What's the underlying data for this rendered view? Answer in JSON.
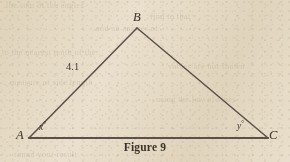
{
  "figure": {
    "caption": "Figure 9",
    "background_color": "#ece3d2",
    "ink_color": "#5a5148",
    "shape": "triangle",
    "vertices": [
      {
        "name": "B",
        "label": "B",
        "x": 137,
        "y": 28
      },
      {
        "name": "A",
        "label": "A",
        "x": 29,
        "y": 138
      },
      {
        "name": "C",
        "label": "C",
        "x": 268,
        "y": 138
      }
    ],
    "side_labels": [
      {
        "name": "AB",
        "label": "4.1",
        "x": 66,
        "y": 61
      }
    ],
    "angle_labels": [
      {
        "name": "angle-A",
        "variable": "x",
        "degree_symbol": "°",
        "x": 39,
        "y": 122
      },
      {
        "name": "angle-C",
        "variable": "y",
        "degree_symbol": "°",
        "x": 237,
        "y": 121
      }
    ],
    "ghost_text": [
      "the sum of the angles",
      "find to that",
      "and an answer of",
      "to the nearest tenth of the",
      "values are not shown",
      "measure of side length",
      "using the law of sines",
      "round your result"
    ]
  }
}
